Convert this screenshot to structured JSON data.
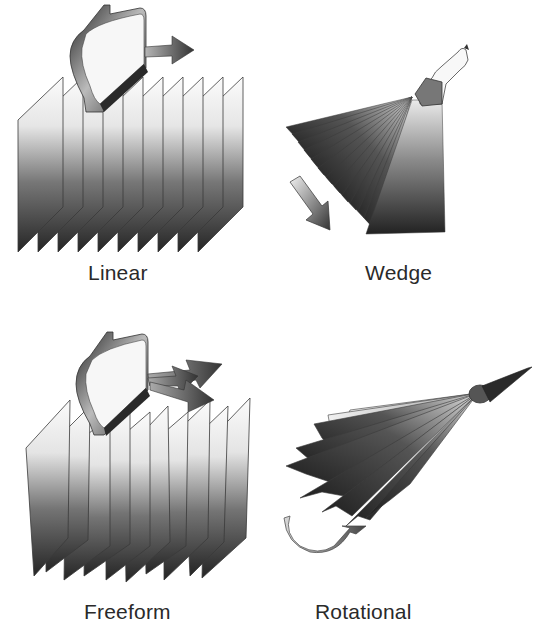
{
  "diagram": {
    "panels": [
      {
        "id": "linear",
        "label": "Linear",
        "slices": 10,
        "motion": "straight translation arrow"
      },
      {
        "id": "wedge",
        "label": "Wedge",
        "slices": 14,
        "motion": "tilting arrow"
      },
      {
        "id": "freeform",
        "label": "Freeform",
        "slices": 10,
        "motion": "multi-direction arrows"
      },
      {
        "id": "rotational",
        "label": "Rotational",
        "slices": 8,
        "motion": "curved rotation arrow"
      }
    ]
  },
  "colors": {
    "background": "#ffffff",
    "slice_top": "#f4f4f4",
    "slice_bottom": "#2b2b2b",
    "outline": "#3a3a3a",
    "caption": "#2a2a2a"
  }
}
